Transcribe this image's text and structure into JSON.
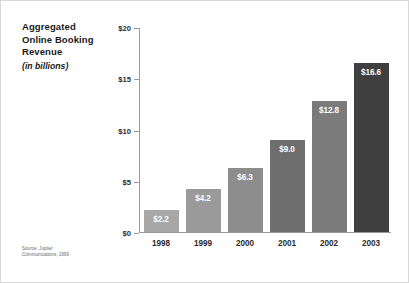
{
  "title": {
    "lines": [
      "Aggregated",
      "Online Booking",
      "Revenue"
    ],
    "subtitle": "(in billions)"
  },
  "source": {
    "lines": [
      "Source: Jupiter",
      "Communications, 1999"
    ]
  },
  "chart_data": {
    "type": "bar",
    "title": "Aggregated Online Booking Revenue",
    "subtitle": "(in billions)",
    "xlabel": "",
    "ylabel": "",
    "ylim": [
      0,
      20
    ],
    "yticks": [
      0,
      5,
      10,
      15,
      20
    ],
    "ytick_labels": [
      "$0",
      "$5",
      "$10",
      "$15",
      "$20"
    ],
    "grid": false,
    "legend": "none",
    "categories": [
      "1998",
      "1999",
      "2000",
      "2001",
      "2002",
      "2003"
    ],
    "values": [
      2.2,
      4.2,
      6.3,
      9.0,
      12.8,
      16.6
    ],
    "value_labels": [
      "$2.2",
      "$4.2",
      "$6.3",
      "$9.0",
      "$12.8",
      "$16.6"
    ],
    "bar_colors": [
      "#a7a7a7",
      "#9a9a9a",
      "#8d8d8d",
      "#6e6e6e",
      "#7b7b7b",
      "#3f3f3f"
    ],
    "value_label_color": "#ffffff",
    "axis_color": "#9a9a9a"
  }
}
